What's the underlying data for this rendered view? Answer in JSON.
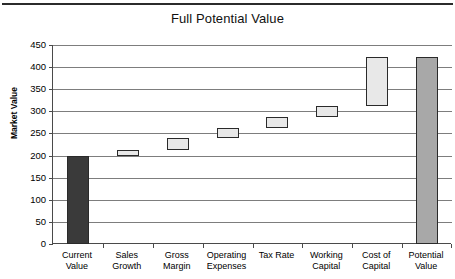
{
  "chart_data": {
    "type": "bar",
    "subtype": "waterfall",
    "title": "Full Potential Value",
    "xlabel": "",
    "ylabel": "Market Value",
    "ylim": [
      0,
      450
    ],
    "ytick_step": 50,
    "yticks": [
      450,
      400,
      350,
      300,
      250,
      200,
      150,
      100,
      50,
      0
    ],
    "grid": true,
    "legend": false,
    "categories": [
      "Current Value",
      "Sales Growth",
      "Gross Margin",
      "Operating Expenses",
      "Tax Rate",
      "Working Capital",
      "Cost of Capital",
      "Potential Value"
    ],
    "category_lines": [
      [
        "Current",
        "Value"
      ],
      [
        "Sales",
        "Growth"
      ],
      [
        "Gross",
        "Margin"
      ],
      [
        "Operating",
        "Expenses"
      ],
      [
        "Tax Rate",
        ""
      ],
      [
        "Working",
        "Capital"
      ],
      [
        "Cost of",
        "Capital"
      ],
      [
        "Potential",
        "Value"
      ]
    ],
    "bars": [
      {
        "label": "Current Value",
        "base": 0,
        "top": 198,
        "value": 198,
        "kind": "total"
      },
      {
        "label": "Sales Growth",
        "base": 198,
        "top": 213,
        "value": 15,
        "kind": "increase"
      },
      {
        "label": "Gross Margin",
        "base": 213,
        "top": 240,
        "value": 27,
        "kind": "increase"
      },
      {
        "label": "Operating Expenses",
        "base": 240,
        "top": 262,
        "value": 22,
        "kind": "increase"
      },
      {
        "label": "Tax Rate",
        "base": 262,
        "top": 288,
        "value": 26,
        "kind": "increase"
      },
      {
        "label": "Working Capital",
        "base": 288,
        "top": 312,
        "value": 24,
        "kind": "increase"
      },
      {
        "label": "Cost of Capital",
        "base": 312,
        "top": 422,
        "value": 110,
        "kind": "increase"
      },
      {
        "label": "Potential Value",
        "base": 0,
        "top": 422,
        "value": 422,
        "kind": "total-end"
      }
    ],
    "colors": {
      "start_total_fill": "#3a3a3a",
      "step_fill": "#e8e8e8",
      "end_total_fill": "#a8a8a8",
      "bar_border": "#2a2a2a",
      "gridline": "#7d7d7d",
      "axis": "#4a4a4a",
      "text": "#000000",
      "background": "#ffffff"
    }
  }
}
